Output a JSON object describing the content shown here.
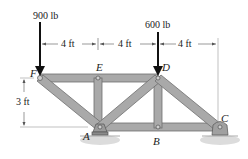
{
  "loads": [
    {
      "label": "900 lb",
      "joint": "F"
    },
    {
      "label": "600 lb",
      "joint": "D"
    }
  ],
  "dimensions": {
    "horizontal": [
      "4 ft",
      "4 ft",
      "4 ft"
    ],
    "vertical": "3 ft"
  },
  "joints": {
    "F": "F",
    "E": "E",
    "D": "D",
    "A": "A",
    "B": "B",
    "C": "C"
  },
  "colors": {
    "member": "#a9a9a9",
    "member_edge": "#6e6e6e",
    "load_arrow": "#111111",
    "dim_line": "#555555",
    "ground": "#d9d9d9"
  }
}
